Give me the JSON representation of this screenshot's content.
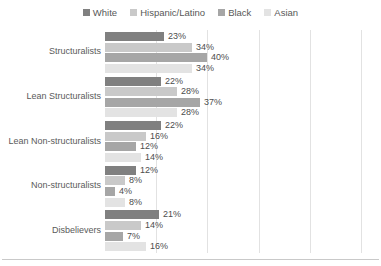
{
  "chart_data": {
    "type": "bar",
    "orientation": "horizontal",
    "title": "",
    "xlabel": "",
    "ylabel": "",
    "xlim": [
      0,
      105
    ],
    "grid": true,
    "grid_axis": "x",
    "gridline_values": [
      20,
      40,
      60,
      80,
      100
    ],
    "legend_position": "top-center",
    "value_suffix": "%",
    "categories": [
      "Structuralists",
      "Lean Structuralists",
      "Lean Non-structuralists",
      "Non-structuralists",
      "Disbelievers"
    ],
    "series": [
      {
        "name": "White",
        "color": "#808080",
        "values": [
          23,
          22,
          22,
          12,
          21
        ],
        "labels": [
          "23%",
          "22%",
          "22%",
          "12%",
          "21%"
        ]
      },
      {
        "name": "Hispanic/Latino",
        "color": "#c9c9c9",
        "values": [
          34,
          28,
          16,
          8,
          14
        ],
        "labels": [
          "34%",
          "28%",
          "16%",
          "8%",
          "14%"
        ]
      },
      {
        "name": "Black",
        "color": "#a6a6a6",
        "values": [
          40,
          37,
          12,
          4,
          7
        ],
        "labels": [
          "40%",
          "37%",
          "12%",
          "4%",
          "7%"
        ]
      },
      {
        "name": "Asian",
        "color": "#e3e3e3",
        "values": [
          34,
          28,
          14,
          8,
          16
        ],
        "labels": [
          "34%",
          "28%",
          "14%",
          "8%",
          "16%"
        ]
      }
    ]
  },
  "legend": {
    "items": [
      {
        "label": "White",
        "color": "#808080"
      },
      {
        "label": "Hispanic/Latino",
        "color": "#c9c9c9"
      },
      {
        "label": "Black",
        "color": "#a6a6a6"
      },
      {
        "label": "Asian",
        "color": "#e3e3e3"
      }
    ]
  }
}
